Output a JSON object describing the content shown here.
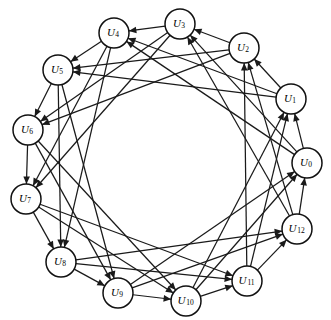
{
  "figure": {
    "name": "circulant-digraph",
    "background_color": "#ffffff",
    "ink_color": "#1a1a1a",
    "node_fill": "#ffffff",
    "node_stroke": "#111111",
    "width": 331,
    "height": 320,
    "center_x": 167,
    "center_y": 166,
    "ring_radius": 140,
    "node_radius": 15,
    "node_count": 13
  },
  "chart_data": {
    "type": "diagram",
    "subtype": "directed-circulant-graph",
    "title": "",
    "node_count": 13,
    "connection_offsets": [
      1,
      3,
      4
    ],
    "directed": true,
    "nodes": [
      {
        "id": 0,
        "label_base": "U",
        "label_sub": "0",
        "x": 307,
        "y": 163,
        "angle_deg": 0
      },
      {
        "id": 1,
        "label_base": "U",
        "label_sub": "1",
        "x": 291,
        "y": 99,
        "angle_deg": 27.7
      },
      {
        "id": 2,
        "label_base": "U",
        "label_sub": "2",
        "x": 244,
        "y": 48,
        "angle_deg": 55.4
      },
      {
        "id": 3,
        "label_base": "U",
        "label_sub": "3",
        "x": 180,
        "y": 24,
        "angle_deg": 83.1
      },
      {
        "id": 4,
        "label_base": "U",
        "label_sub": "4",
        "x": 114,
        "y": 33,
        "angle_deg": 110.8
      },
      {
        "id": 5,
        "label_base": "U",
        "label_sub": "5",
        "x": 58,
        "y": 70,
        "angle_deg": 138.5
      },
      {
        "id": 6,
        "label_base": "U",
        "label_sub": "6",
        "x": 28,
        "y": 130,
        "angle_deg": 166.2
      },
      {
        "id": 7,
        "label_base": "U",
        "label_sub": "7",
        "x": 26,
        "y": 199,
        "angle_deg": 193.8
      },
      {
        "id": 8,
        "label_base": "U",
        "label_sub": "8",
        "x": 61,
        "y": 262,
        "angle_deg": 221.5
      },
      {
        "id": 9,
        "label_base": "U",
        "label_sub": "9",
        "x": 118,
        "y": 293,
        "angle_deg": 249.2
      },
      {
        "id": 10,
        "label_base": "U",
        "label_sub": "10",
        "x": 186,
        "y": 301,
        "angle_deg": 276.9
      },
      {
        "id": 11,
        "label_base": "U",
        "label_sub": "11",
        "x": 247,
        "y": 281,
        "angle_deg": 304.6
      },
      {
        "id": 12,
        "label_base": "U",
        "label_sub": "12",
        "x": 297,
        "y": 229,
        "angle_deg": 332.3
      }
    ],
    "edges": [
      {
        "from": 0,
        "to": 1
      },
      {
        "from": 0,
        "to": 3
      },
      {
        "from": 0,
        "to": 4
      },
      {
        "from": 1,
        "to": 2
      },
      {
        "from": 1,
        "to": 4
      },
      {
        "from": 1,
        "to": 5
      },
      {
        "from": 2,
        "to": 3
      },
      {
        "from": 2,
        "to": 5
      },
      {
        "from": 2,
        "to": 6
      },
      {
        "from": 3,
        "to": 4
      },
      {
        "from": 3,
        "to": 6
      },
      {
        "from": 3,
        "to": 7
      },
      {
        "from": 4,
        "to": 5
      },
      {
        "from": 4,
        "to": 7
      },
      {
        "from": 4,
        "to": 8
      },
      {
        "from": 5,
        "to": 6
      },
      {
        "from": 5,
        "to": 8
      },
      {
        "from": 5,
        "to": 9
      },
      {
        "from": 6,
        "to": 7
      },
      {
        "from": 6,
        "to": 9
      },
      {
        "from": 6,
        "to": 10
      },
      {
        "from": 7,
        "to": 8
      },
      {
        "from": 7,
        "to": 10
      },
      {
        "from": 7,
        "to": 11
      },
      {
        "from": 8,
        "to": 9
      },
      {
        "from": 8,
        "to": 11
      },
      {
        "from": 8,
        "to": 12
      },
      {
        "from": 9,
        "to": 10
      },
      {
        "from": 9,
        "to": 12
      },
      {
        "from": 9,
        "to": 0
      },
      {
        "from": 10,
        "to": 11
      },
      {
        "from": 10,
        "to": 0
      },
      {
        "from": 10,
        "to": 1
      },
      {
        "from": 11,
        "to": 12
      },
      {
        "from": 11,
        "to": 1
      },
      {
        "from": 11,
        "to": 2
      },
      {
        "from": 12,
        "to": 0
      },
      {
        "from": 12,
        "to": 2
      },
      {
        "from": 12,
        "to": 3
      }
    ]
  }
}
